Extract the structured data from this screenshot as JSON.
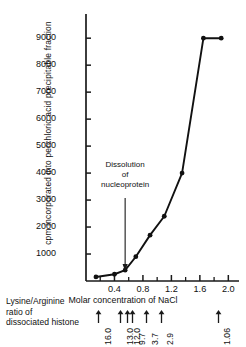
{
  "chart_data": {
    "type": "line",
    "title": "",
    "xlabel": "Molar concentration of NaCl",
    "ylabel": "cpm incorporated into perchloric acid precipitable fraction",
    "xlim": [
      0.0,
      2.15
    ],
    "ylim": [
      0,
      9600
    ],
    "grid": false,
    "legend": "none",
    "marker": "filled-circle",
    "x": [
      0.14,
      0.4,
      0.55,
      0.7,
      0.9,
      1.1,
      1.35,
      1.65,
      1.9
    ],
    "y": [
      150,
      250,
      400,
      900,
      1700,
      2400,
      4000,
      9000,
      9000
    ],
    "points": [
      {
        "x": 0.14,
        "y": 150
      },
      {
        "x": 0.4,
        "y": 250
      },
      {
        "x": 0.55,
        "y": 400
      },
      {
        "x": 0.7,
        "y": 900
      },
      {
        "x": 0.9,
        "y": 1700
      },
      {
        "x": 1.1,
        "y": 2400
      },
      {
        "x": 1.35,
        "y": 4000
      },
      {
        "x": 1.65,
        "y": 9000
      },
      {
        "x": 1.9,
        "y": 9000
      }
    ],
    "yticks": [
      1000,
      2000,
      3000,
      4000,
      5000,
      6000,
      7000,
      8000,
      9000
    ],
    "ytick_labels": [
      "1000",
      "2000",
      "3000",
      "4000",
      "5000",
      "6000",
      "7000",
      "8000",
      "9000"
    ],
    "xticks": [
      0.4,
      0.8,
      1.2,
      1.6,
      2.0
    ],
    "xtick_labels": [
      "0.4",
      "0.8",
      "1.2",
      "1.6",
      "2.0"
    ],
    "x_minor_ticks": [
      0.2,
      0.6,
      1.0,
      1.4,
      1.8
    ],
    "annotations": [
      {
        "name": "dissolution-annotation",
        "lines": [
          "Dissolution",
          "of",
          "nucleoprotein"
        ],
        "arrow_to_x": 0.55,
        "arrow_to_y": 330
      }
    ]
  },
  "axis": {
    "y_title": "cpm incorporated into perchloric acid precipitable fraction",
    "x_title": "Molar concentration of NaCl"
  },
  "annotation": {
    "line1": "Dissolution",
    "line2": "of",
    "line3": "nucleoprotein"
  },
  "caption": {
    "line1": "Lysine/Arginine",
    "line2": "ratio of",
    "line3": "dissociated  histone"
  },
  "ratio_axis": {
    "label": "Lysine/Arginine ratio of dissociated histone",
    "items": [
      {
        "value": "16.0",
        "x": 0.18
      },
      {
        "value": "13.0",
        "x": 0.49
      },
      {
        "value": "12.0",
        "x": 0.585
      },
      {
        "value": "9.7",
        "x": 0.655
      },
      {
        "value": "3.7",
        "x": 0.85
      },
      {
        "value": "2.9",
        "x": 1.06
      },
      {
        "value": "1.06",
        "x": 1.86
      }
    ]
  },
  "colors": {
    "axis": "#1a1a1a",
    "curve": "#111111",
    "text": "#111111",
    "background": "#ffffff"
  }
}
